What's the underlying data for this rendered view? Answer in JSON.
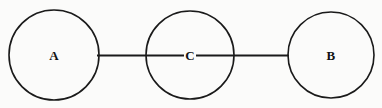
{
  "figure": {
    "type": "node-link-diagram",
    "background_color": "#fbfbfa",
    "stroke_color": "#1a1a1a",
    "label_color": "#121212",
    "width": 382,
    "height": 108
  },
  "nodes": [
    {
      "id": "A",
      "label": "A",
      "shape": "circle",
      "cx": 54,
      "cy": 55,
      "r": 45,
      "fill": "none",
      "stroke_width": 1.6
    },
    {
      "id": "C",
      "label": "C",
      "shape": "circle",
      "cx": 190,
      "cy": 55,
      "r": 44,
      "fill": "none",
      "stroke_width": 1.6
    },
    {
      "id": "B",
      "label": "B",
      "shape": "circle",
      "cx": 331,
      "cy": 55,
      "r": 43,
      "fill": "none",
      "stroke_width": 1.6
    }
  ],
  "edges": [
    {
      "id": "edge-a-c",
      "from": "A",
      "to": "C",
      "x1": 97,
      "y1": 55.5,
      "x2": 190,
      "y2": 55.5,
      "stroke_width": 2
    },
    {
      "id": "edge-c-b",
      "from": "C",
      "to": "B",
      "x1": 190,
      "y1": 55.5,
      "x2": 289,
      "y2": 55.5,
      "stroke_width": 2
    }
  ]
}
